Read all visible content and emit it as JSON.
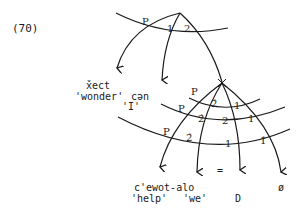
{
  "example_number": "(70)",
  "top_fan": {
    "labels": {
      "p": "P",
      "one": "1",
      "two": "2"
    }
  },
  "top_outputs": {
    "word": "x̌ect",
    "gloss": "'wonder'",
    "suffix": "cən",
    "suffix_gloss": "'I'"
  },
  "bottom_fan": {
    "row1": {
      "p": "P",
      "a": "2̂",
      "b": "1"
    },
    "row2": {
      "p": "P",
      "a": "2̂",
      "b": "2",
      "c": "1"
    },
    "row3": {
      "p": "P",
      "a": "2̂",
      "b": "1",
      "c": "1̂"
    },
    "equals": "="
  },
  "bottom_outputs": {
    "word": "c'ewot-alo",
    "gloss": "'help'",
    "we": "'we'",
    "d": "D",
    "null": "ø"
  }
}
